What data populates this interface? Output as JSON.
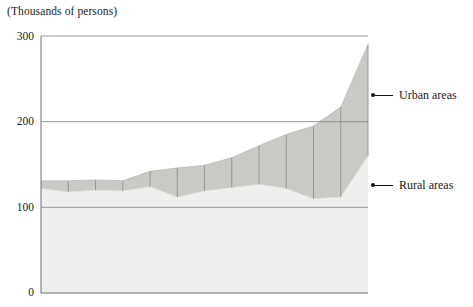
{
  "chart_data": {
    "type": "area",
    "title": "(Thousands of persons)",
    "subtitle": "",
    "xlabel": "",
    "ylabel": "(Thousands of persons)",
    "ylim": [
      0,
      300
    ],
    "yticks": [
      0,
      100,
      200,
      300
    ],
    "ytick_labels": [
      "0",
      "100",
      "200",
      "300"
    ],
    "grid": true,
    "gridlines": [
      100,
      200,
      300
    ],
    "stacked": true,
    "legend_position": "right",
    "x": [
      1,
      2,
      3,
      4,
      5,
      6,
      7,
      8,
      9,
      10,
      11,
      12,
      13
    ],
    "segment_dividers": 12,
    "series": [
      {
        "name": "Rural areas",
        "color": "#eeeeec",
        "values": [
          122,
          118,
          120,
          119,
          124,
          112,
          119,
          123,
          127,
          122,
          110,
          112,
          160
        ]
      },
      {
        "name": "Urban areas",
        "color": "#c8c8c4",
        "values": [
          9,
          13,
          12,
          12,
          18,
          34,
          30,
          35,
          45,
          63,
          85,
          105,
          130
        ]
      }
    ],
    "totals": [
      131,
      131,
      132,
      131,
      142,
      146,
      149,
      158,
      172,
      185,
      195,
      217,
      290
    ],
    "annotations": [
      {
        "label": "Urban areas",
        "target_value": 230
      },
      {
        "label": "Rural areas",
        "target_value": 135
      }
    ]
  },
  "axes": {
    "y_label_300": "300",
    "y_label_200": "200",
    "y_label_100": "100",
    "y_label_0": "0",
    "axis_color": "#6f6f6f",
    "grid_color": "#8a8a8a"
  },
  "legend": {
    "urban_label": "Urban areas",
    "rural_label": "Rural areas"
  },
  "colors": {
    "urban_band": "#c9c9c5",
    "rural_band": "#efefed",
    "background": "#ffffff",
    "divider": "#8f8f8f",
    "leader": "#111111"
  }
}
